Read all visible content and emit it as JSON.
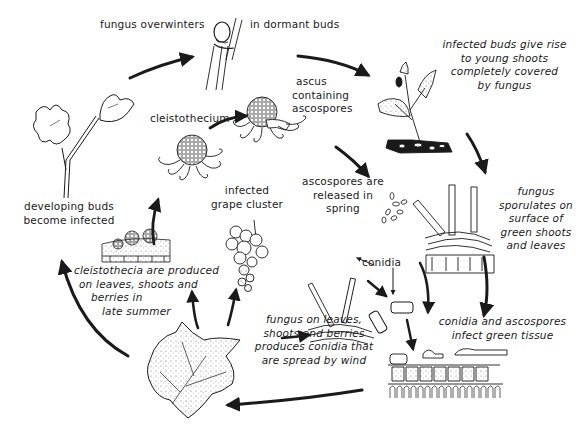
{
  "diagram": {
    "type": "disease-cycle",
    "colors": {
      "ink": "#1a1a1a",
      "background": "#ffffff"
    },
    "stages": {
      "overwinter": {
        "left": "fungus overwinters",
        "right": "in dormant buds"
      },
      "shoots": {
        "lines": [
          "infected buds give rise",
          "to young shoots",
          "completely covered",
          "by fungus"
        ]
      },
      "sporulates": {
        "lines": [
          "fungus",
          "sporulates on",
          "surface of",
          "green shoots",
          "and leaves"
        ]
      },
      "infect": {
        "lines": [
          "conidia and ascospores",
          "infect green tissue"
        ]
      },
      "conidia_spread": {
        "lines": [
          "fungus on leaves,",
          "shoots and berries",
          "produces conidia that",
          "are spread by wind"
        ]
      },
      "cleistothecia_produced": {
        "lines": [
          "cleistothecia are produced",
          "on leaves, shoots and",
          "berries in",
          "late summer"
        ]
      },
      "developing_buds": {
        "lines": [
          "developing buds",
          "become infected"
        ]
      },
      "cleistothecium": {
        "label": "cleistothecium"
      },
      "ascus": {
        "lines": [
          "ascus",
          "containing",
          "ascospores"
        ]
      },
      "ascospores_released": {
        "lines": [
          "ascospores are",
          "released in",
          "spring"
        ]
      },
      "grape_cluster": {
        "lines": [
          "infected",
          "grape cluster"
        ]
      },
      "conidia": {
        "label": "conidia"
      }
    },
    "illustrations": [
      "dormant-bud-cane",
      "infected-shoot",
      "sporulating-hyphae-on-tissue",
      "infected-leaf-tissue-cross-section",
      "conidia-spores",
      "infected-grape-leaf",
      "infected-grape-cluster",
      "cleistothecia-on-tissue",
      "cleistothecium",
      "ascus-with-ascospores",
      "ascospores",
      "conidiophores",
      "developing-shoot-with-leaves"
    ]
  }
}
